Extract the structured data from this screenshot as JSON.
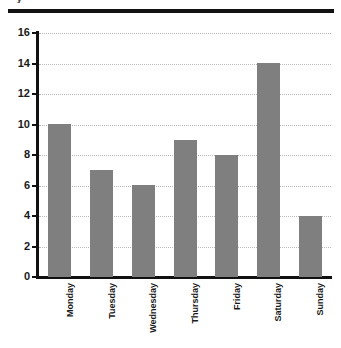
{
  "header": {
    "clipped_title_fragment": "y",
    "rule_color": "#111111"
  },
  "chart_data": {
    "type": "bar",
    "title": "",
    "xlabel": "",
    "ylabel": "",
    "categories": [
      "Monday",
      "Tuesday",
      "Wednesday",
      "Thursday",
      "Friday",
      "Saturday",
      "Sunday"
    ],
    "values": [
      10,
      7,
      6,
      9,
      8,
      14,
      4
    ],
    "ylim": [
      0,
      16
    ],
    "ytick_step": 2,
    "yticks": [
      0,
      2,
      4,
      6,
      8,
      10,
      12,
      14,
      16
    ],
    "ytick_labels": [
      "0",
      "2",
      "4",
      "6",
      "8",
      "10",
      "12",
      "14",
      "16"
    ],
    "grid": true,
    "grid_axis": "y",
    "grid_style": "dotted",
    "legend": false,
    "legend_position": "none",
    "bar_color": "#7f7f7f",
    "grid_color": "#b9b9b9",
    "axis_color": "#111111",
    "background_color": "#ffffff",
    "xlabel_rotation": 90
  }
}
